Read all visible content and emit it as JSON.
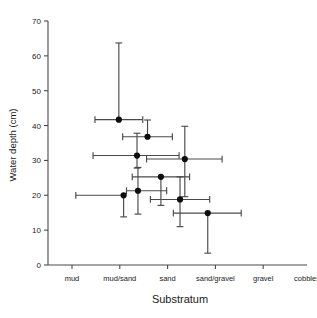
{
  "chart_data": {
    "type": "scatter",
    "title": "",
    "subtitle": "",
    "xlabel": "Substratum",
    "ylabel": "Water depth (cm)",
    "x_categories": [
      "mud",
      "mud/sand",
      "sand",
      "sand/gravel",
      "gravel",
      "cobbles"
    ],
    "x_category_indices": [
      0,
      1,
      2,
      3,
      4,
      5
    ],
    "xlim": [
      -0.5,
      5.35
    ],
    "ylim": [
      0,
      70
    ],
    "y_ticks": [
      0,
      10,
      20,
      30,
      40,
      50,
      60,
      70
    ],
    "y_tick_labels": [
      "0",
      "10",
      "20",
      "30",
      "40",
      "50",
      "60",
      "70"
    ],
    "grid": false,
    "legend": null,
    "legend_position": "none",
    "error_bars": "both",
    "marker": "filled-circle",
    "note": "x values are continuous positions along the ordered substratum scale (0=mud, 1=mud/sand, 2=sand, 3=sand/gravel, 4=gravel, 5=cobbles)",
    "points": [
      {
        "id": "p1",
        "x": 0.98,
        "y": 41.7,
        "x_err_low": 0.5,
        "x_err_high": 0.5,
        "y_err_low": 0.0,
        "y_err_high": 22.0
      },
      {
        "id": "p2",
        "x": 1.58,
        "y": 36.8,
        "x_err_low": 0.52,
        "x_err_high": 0.52,
        "y_err_low": 0.0,
        "y_err_high": 4.8
      },
      {
        "id": "p3",
        "x": 1.36,
        "y": 31.4,
        "x_err_low": 0.92,
        "x_err_high": 0.88,
        "y_err_low": 3.6,
        "y_err_high": 6.4
      },
      {
        "id": "p4",
        "x": 2.36,
        "y": 30.4,
        "x_err_low": 0.8,
        "x_err_high": 0.78,
        "y_err_low": 10.8,
        "y_err_high": 9.4
      },
      {
        "id": "p5",
        "x": 1.86,
        "y": 25.3,
        "x_err_low": 0.6,
        "x_err_high": 0.6,
        "y_err_low": 8.2,
        "y_err_high": 0.0
      },
      {
        "id": "p6",
        "x": 1.38,
        "y": 21.3,
        "x_err_low": 0.24,
        "x_err_high": 0.6,
        "y_err_low": 6.7,
        "y_err_high": 6.7
      },
      {
        "id": "p7",
        "x": 1.08,
        "y": 20.0,
        "x_err_low": 1.0,
        "x_err_high": 0.0,
        "y_err_low": 6.2,
        "y_err_high": 0.0
      },
      {
        "id": "p8",
        "x": 2.26,
        "y": 18.8,
        "x_err_low": 0.62,
        "x_err_high": 0.62,
        "y_err_low": 7.8,
        "y_err_high": 6.5
      },
      {
        "id": "p9",
        "x": 2.84,
        "y": 14.9,
        "x_err_low": 0.72,
        "x_err_high": 0.7,
        "y_err_low": 11.5,
        "y_err_high": 0.0
      }
    ]
  }
}
